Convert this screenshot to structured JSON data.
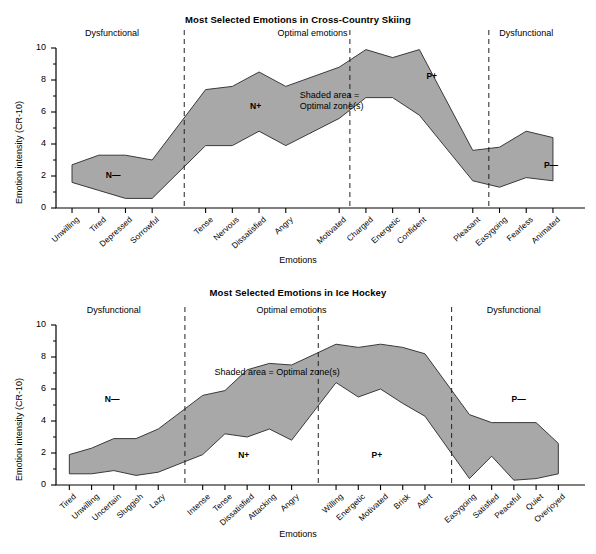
{
  "figure": {
    "background": "#ffffff",
    "band_fill": "#a8a8a8",
    "band_stroke": "#3a3a3a",
    "axis_color": "#000000",
    "divider_style": "dashed"
  },
  "charts": [
    {
      "id": "cross-country-skiing",
      "title": "Most Selected Emotions in Cross-Country Skiing",
      "ylabel": "Emotion intensity (CR-10)",
      "xlabel": "Emotions",
      "yticks": [
        0,
        2,
        4,
        6,
        8,
        10
      ],
      "ylim": [
        0,
        10
      ],
      "region_labels": [
        {
          "text": "Dysfunctional",
          "at_index": 1.5
        },
        {
          "text": "Optimal emotions",
          "at_index": 7.5
        },
        {
          "text": "Dysfunctional",
          "at_index": 14.0
        }
      ],
      "zone_labels": [
        {
          "text": "N—",
          "at_index": 1.6,
          "value": 2.0
        },
        {
          "text": "N+",
          "at_index": 6.0,
          "value": 6.3
        },
        {
          "text": "P+",
          "at_index": 11.3,
          "value": 8.2
        },
        {
          "text": "P—",
          "at_index": 15.2,
          "value": 2.6
        }
      ],
      "annotation": {
        "line1": "Shaded area =",
        "line2": "Optimal zone(s)",
        "at_index": 8.1,
        "value": 6.9
      },
      "dividers": [
        3.6,
        8.4,
        12.6
      ],
      "chart_data": {
        "type": "area",
        "title": "Most Selected Emotions in Cross-Country Skiing",
        "xlabel": "Emotions",
        "ylabel": "Emotion intensity (CR-10)",
        "ylim": [
          0,
          10
        ],
        "grid": false,
        "legend": "none",
        "categories": [
          "Unwilling",
          "Tired",
          "Depressed",
          "Sorrowful",
          "Tense",
          "Nervous",
          "Dissatisfied",
          "Angry",
          "Motivated",
          "Charged",
          "Energetic",
          "Confident",
          "Pleasant",
          "Easygoing",
          "Fearless",
          "Animated"
        ],
        "category_gaps_after": [
          3,
          7,
          11
        ],
        "series": [
          {
            "name": "Upper bound of optimal zone",
            "values": [
              2.7,
              3.3,
              3.3,
              3.0,
              7.4,
              7.6,
              8.5,
              7.6,
              8.8,
              9.9,
              9.4,
              9.9,
              3.6,
              3.8,
              4.8,
              4.4
            ]
          },
          {
            "name": "Lower bound of optimal zone",
            "values": [
              1.6,
              1.1,
              0.6,
              0.6,
              3.9,
              3.9,
              4.8,
              3.9,
              5.6,
              6.9,
              6.9,
              5.8,
              1.7,
              1.3,
              1.9,
              1.7
            ]
          }
        ]
      }
    },
    {
      "id": "ice-hockey",
      "title": "Most Selected Emotions in Ice Hockey",
      "ylabel": "Emotion intensity (CR-10)",
      "xlabel": "Emotions",
      "yticks": [
        0,
        2,
        4,
        6,
        8,
        10
      ],
      "ylim": [
        0,
        10
      ],
      "region_labels": [
        {
          "text": "Dysfunctional",
          "at_index": 2.0
        },
        {
          "text": "Optimal emotions",
          "at_index": 9.0
        },
        {
          "text": "Dysfunctional",
          "at_index": 17.0
        }
      ],
      "zone_labels": [
        {
          "text": "N—",
          "at_index": 2.0,
          "value": 5.3
        },
        {
          "text": "N+",
          "at_index": 7.0,
          "value": 1.8
        },
        {
          "text": "P+",
          "at_index": 12.0,
          "value": 1.8
        },
        {
          "text": "P—",
          "at_index": 17.3,
          "value": 5.3
        }
      ],
      "annotation": {
        "line1": "Shaded area = Optimal zone(s)",
        "line2": "",
        "at_index": 9.2,
        "value": 6.9
      },
      "dividers": [
        4.6,
        9.6,
        14.6
      ],
      "chart_data": {
        "type": "area",
        "title": "Most Selected Emotions in Ice Hockey",
        "xlabel": "Emotions",
        "ylabel": "Emotion intensity (CR-10)",
        "ylim": [
          0,
          10
        ],
        "grid": false,
        "legend": "none",
        "categories": [
          "Tired",
          "Unwilling",
          "Uncertain",
          "Sluggish",
          "Lazy",
          "Intense",
          "Tense",
          "Dissatisfied",
          "Attacking",
          "Angry",
          "Willing",
          "Energetic",
          "Motivated",
          "Brisk",
          "Alert",
          "Easygoing",
          "Satisfied",
          "Peaceful",
          "Quiet",
          "Overjoyed"
        ],
        "category_gaps_after": [
          4,
          9,
          14
        ],
        "series": [
          {
            "name": "Upper bound of optimal zone",
            "values": [
              1.9,
              2.3,
              2.9,
              2.9,
              3.5,
              5.6,
              5.9,
              7.2,
              7.6,
              7.5,
              8.8,
              8.6,
              8.8,
              8.6,
              8.2,
              4.4,
              3.9,
              3.9,
              3.9,
              2.6
            ]
          },
          {
            "name": "Lower bound of optimal zone",
            "values": [
              0.7,
              0.7,
              0.9,
              0.6,
              0.8,
              1.9,
              3.2,
              3.0,
              3.5,
              2.8,
              6.4,
              5.5,
              6.0,
              5.1,
              4.3,
              0.4,
              1.8,
              0.3,
              0.4,
              0.7
            ]
          }
        ]
      }
    }
  ]
}
